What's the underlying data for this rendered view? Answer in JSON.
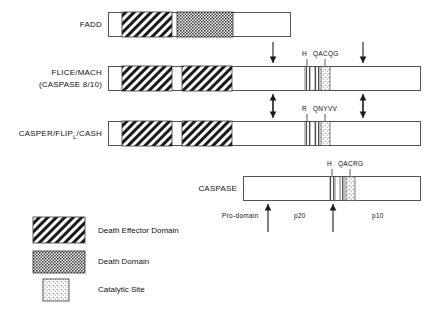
{
  "figure": {
    "type": "protein-domain-diagram",
    "background": "#ffffff",
    "stroke_color": "#555555"
  },
  "rows": [
    {
      "id": "fadd",
      "label": "FADD",
      "label_line2": "",
      "bar": {
        "x": 108,
        "y": 12,
        "w": 182,
        "h": 24
      },
      "blocks": [
        {
          "kind": "death-effector-domain",
          "x": 122,
          "y": 12,
          "w": 50,
          "h": 24
        },
        {
          "kind": "death-domain",
          "x": 177,
          "y": 12,
          "w": 56,
          "h": 24
        }
      ],
      "catalytic": [],
      "stripes": [],
      "arrows": [],
      "site_labels": []
    },
    {
      "id": "flice-mach",
      "label": "FLICE/MACH",
      "label_line2": "(CASPASE 8/10)",
      "bar": {
        "x": 108,
        "y": 66,
        "w": 312,
        "h": 24
      },
      "blocks": [
        {
          "kind": "death-effector-domain",
          "x": 122,
          "y": 66,
          "w": 50,
          "h": 24
        },
        {
          "kind": "death-effector-domain",
          "x": 182,
          "y": 66,
          "w": 50,
          "h": 24
        }
      ],
      "stripes": [
        {
          "x": 305,
          "w": 5
        },
        {
          "x": 315,
          "w": 4
        }
      ],
      "catalytic": [
        {
          "x": 321,
          "w": 9
        }
      ],
      "arrows": [
        {
          "x": 273,
          "dir": "down"
        },
        {
          "x": 363,
          "dir": "down"
        },
        {
          "x": 273,
          "dir": "up"
        },
        {
          "x": 363,
          "dir": "up"
        }
      ],
      "site_labels": [
        {
          "text": "H",
          "x": 305
        },
        {
          "text": "QACQG",
          "x": 318
        }
      ]
    },
    {
      "id": "casper-flip-cash",
      "label": "CASPER/FLIP",
      "label_sub": "L",
      "label_suffix": "/CASH",
      "label_line2": "",
      "bar": {
        "x": 108,
        "y": 121,
        "w": 312,
        "h": 24
      },
      "blocks": [
        {
          "kind": "death-effector-domain",
          "x": 122,
          "y": 121,
          "w": 50,
          "h": 24
        },
        {
          "kind": "death-effector-domain",
          "x": 182,
          "y": 121,
          "w": 50,
          "h": 24
        }
      ],
      "stripes": [
        {
          "x": 305,
          "w": 5
        },
        {
          "x": 315,
          "w": 4
        }
      ],
      "catalytic": [
        {
          "x": 321,
          "w": 9
        }
      ],
      "arrows": [
        {
          "x": 273,
          "dir": "down"
        },
        {
          "x": 363,
          "dir": "down"
        }
      ],
      "site_labels": [
        {
          "text": "R",
          "x": 305
        },
        {
          "text": "QNYVV",
          "x": 318
        }
      ]
    },
    {
      "id": "caspase",
      "label": "CASPASE",
      "label_line2": "",
      "bar": {
        "x": 243,
        "y": 176,
        "w": 177,
        "h": 24
      },
      "blocks": [],
      "stripes": [
        {
          "x": 330,
          "w": 5
        },
        {
          "x": 340,
          "w": 4
        }
      ],
      "catalytic": [
        {
          "x": 346,
          "w": 9
        }
      ],
      "arrows": [
        {
          "x": 268,
          "dir": "up"
        },
        {
          "x": 333,
          "dir": "up"
        }
      ],
      "site_labels": [
        {
          "text": "H",
          "x": 330
        },
        {
          "text": "QACRG",
          "x": 343
        }
      ],
      "segment_labels": [
        {
          "text": "Pro-domain",
          "x": 222
        },
        {
          "text": "p20",
          "x": 298
        },
        {
          "text": "p10",
          "x": 375
        }
      ]
    }
  ],
  "legend": {
    "items": [
      {
        "id": "death-effector-domain",
        "label": "Death Effector Domain",
        "swatch": {
          "x": 33,
          "y": 217,
          "w": 52,
          "h": 26
        }
      },
      {
        "id": "death-domain",
        "label": "Death Domain",
        "swatch": {
          "x": 33,
          "y": 251,
          "w": 52,
          "h": 22
        }
      },
      {
        "id": "catalytic-site",
        "label": "Catalytic Site",
        "swatch": {
          "x": 43,
          "y": 279,
          "w": 26,
          "h": 22
        }
      }
    ],
    "text_x": 98
  }
}
